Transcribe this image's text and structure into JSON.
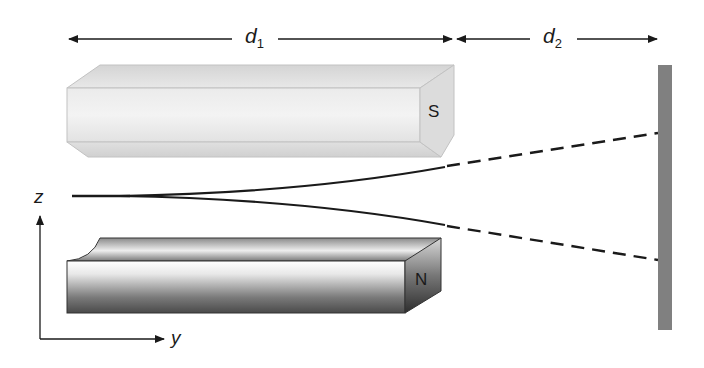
{
  "diagram": {
    "type": "Stern-Gerlach apparatus",
    "dimensions": {
      "d1": {
        "symbol": "d",
        "subscript": "1"
      },
      "d2": {
        "symbol": "d",
        "subscript": "2"
      }
    },
    "magnets": {
      "top": {
        "pole_label": "S"
      },
      "bottom": {
        "pole_label": "N"
      }
    },
    "axes": {
      "vertical": "z",
      "horizontal": "y"
    },
    "beam": {
      "split_into": 2,
      "inside_magnet": "solid curved",
      "after_magnet": "dashed straight"
    },
    "screen": {
      "color": "#808080"
    }
  },
  "colors": {
    "line": "#1a1a1a",
    "s_magnet_face": "#e6e6e6",
    "s_magnet_edge": "#bdbdbd",
    "n_magnet_dark": "#555555",
    "screen": "#808080"
  }
}
